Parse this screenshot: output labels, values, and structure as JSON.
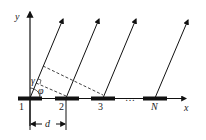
{
  "diagram": {
    "axes": {
      "x_label": "x",
      "y_label": "y"
    },
    "elements": [
      {
        "label": "1"
      },
      {
        "label": "2"
      },
      {
        "label": "3"
      },
      {
        "label": "N"
      }
    ],
    "ellipsis": "…",
    "angles": {
      "gamma": "γ",
      "phi": "φ"
    },
    "spacing_label": "d",
    "colors": {
      "ink": "#111111",
      "background": "#ffffff"
    }
  }
}
